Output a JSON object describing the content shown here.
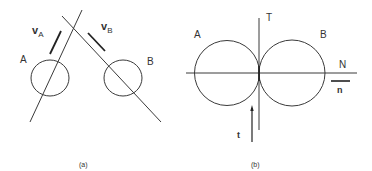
{
  "figure": {
    "panel_a": {
      "caption": "(a)",
      "body_a_label": "A",
      "body_b_label": "B",
      "velocity_a": {
        "symbol": "v",
        "subscript": "A"
      },
      "velocity_b": {
        "symbol": "v",
        "subscript": "B"
      }
    },
    "panel_b": {
      "caption": "(b)",
      "body_a_label": "A",
      "body_b_label": "B",
      "tangent_axis_label": "T",
      "normal_axis_label": "N",
      "tangent_vector_label": "t",
      "normal_vector_label": "n"
    },
    "colors": {
      "line": "#3a3a3a",
      "text": "#333333",
      "background": "#ffffff"
    }
  }
}
